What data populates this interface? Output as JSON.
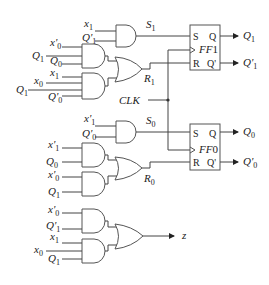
{
  "diagram": {
    "title": "",
    "clock_label": "CLK",
    "flipflops": [
      {
        "name": "FF1",
        "label": "FF",
        "index": "1",
        "pins": {
          "s": "S",
          "r": "R",
          "q": "Q",
          "qn": "Q'"
        },
        "outputs": {
          "q": "Q",
          "q_sub": "1",
          "qn": "Q'",
          "qn_sub": "1"
        }
      },
      {
        "name": "FF0",
        "label": "FF",
        "index": "0",
        "pins": {
          "s": "S",
          "r": "R",
          "q": "Q",
          "qn": "Q'"
        },
        "outputs": {
          "q": "Q",
          "q_sub": "0",
          "qn": "Q'",
          "qn_sub": "0"
        }
      }
    ],
    "signals": {
      "S1": {
        "name": "S",
        "sub": "1"
      },
      "R1": {
        "name": "R",
        "sub": "1"
      },
      "S0": {
        "name": "S",
        "sub": "0"
      },
      "R0": {
        "name": "R",
        "sub": "0"
      },
      "z": {
        "name": "z"
      }
    },
    "gate_inputs": {
      "and_s1": [
        {
          "v": "x",
          "s": "1"
        },
        {
          "v": "Q'",
          "s": "1"
        }
      ],
      "and_r1a": [
        {
          "v": "x'",
          "s": "0"
        },
        {
          "v": "Q",
          "s": "1"
        },
        {
          "v": "Q",
          "s": "0"
        }
      ],
      "and_r1b": [
        {
          "v": "x",
          "s": "1"
        },
        {
          "v": "x",
          "s": "0"
        },
        {
          "v": "Q",
          "s": "1"
        },
        {
          "v": "Q'",
          "s": "0"
        }
      ],
      "and_s0": [
        {
          "v": "x'",
          "s": "1"
        },
        {
          "v": "Q'",
          "s": "0"
        }
      ],
      "and_r0a": [
        {
          "v": "x'",
          "s": "1"
        },
        {
          "v": "Q",
          "s": "0"
        }
      ],
      "and_r0b": [
        {
          "v": "x'",
          "s": "0"
        },
        {
          "v": "Q",
          "s": "1"
        }
      ],
      "and_za": [
        {
          "v": "x'",
          "s": "0"
        },
        {
          "v": "Q'",
          "s": "1"
        }
      ],
      "and_zb": [
        {
          "v": "x",
          "s": "1"
        },
        {
          "v": "x",
          "s": "0"
        },
        {
          "v": "Q",
          "s": "1"
        }
      ]
    }
  }
}
